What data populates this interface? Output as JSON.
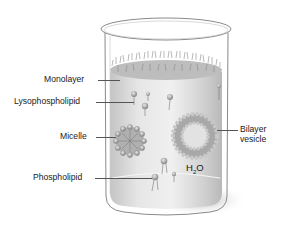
{
  "diagram": {
    "container": "beaker",
    "solvent_label": "H",
    "solvent_sub": "2",
    "solvent_suffix": "O",
    "labels": {
      "monolayer": "Monolayer",
      "lysophospholipid": "Lysophospholipid",
      "micelle": "Micelle",
      "bilayer_line1": "Bilayer",
      "bilayer_line2": "vesicle",
      "phospholipid": "Phospholipid"
    },
    "colors": {
      "beaker_outline": "#8a8a8a",
      "liquid": "#d4d4d4",
      "liquid_highlight": "#f2f2f2",
      "lipid_head": "#9a9a9a",
      "tail": "#7a7a7a",
      "shadow": "#bdbdbd",
      "text": "#1a1a1a"
    }
  }
}
